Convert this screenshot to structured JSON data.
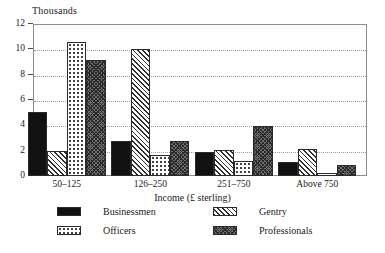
{
  "chart_data": {
    "type": "bar",
    "title": "",
    "unit_caption": "Thousands",
    "xlabel": "Income (£ sterling)",
    "ylabel": "Thousands",
    "categories": [
      "50–125",
      "126–250",
      "251–750",
      "Above 750"
    ],
    "series": [
      {
        "name": "Businessmen",
        "pattern": "solid-black",
        "values": [
          5.05,
          2.75,
          1.9,
          1.1
        ]
      },
      {
        "name": "Gentry",
        "pattern": "diagonal-hatch",
        "values": [
          2.0,
          10.0,
          2.05,
          2.1
        ]
      },
      {
        "name": "Officers",
        "pattern": "dotted",
        "values": [
          10.6,
          1.65,
          1.2,
          0.22
        ]
      },
      {
        "name": "Professionals",
        "pattern": "dense-crosshatch",
        "values": [
          9.15,
          2.75,
          3.95,
          0.85
        ]
      }
    ],
    "ylim": [
      0,
      12
    ],
    "yticks": [
      0,
      2,
      4,
      6,
      8,
      10,
      12
    ],
    "ytick_labels": [
      "0",
      "2",
      "4",
      "6",
      "8",
      "10",
      "12"
    ],
    "grid": true,
    "grid_axis": "y",
    "legend_position": "bottom",
    "legend_columns": 2,
    "colors": {
      "bar_outline": "#2a2a2a",
      "solid_fill": "#111111",
      "hatch_ink": "#2f2f2f",
      "frame": "#8d8d8d",
      "gridline": "#9a9a9a",
      "background": "#ffffff",
      "text": "#1a1a1a"
    }
  }
}
